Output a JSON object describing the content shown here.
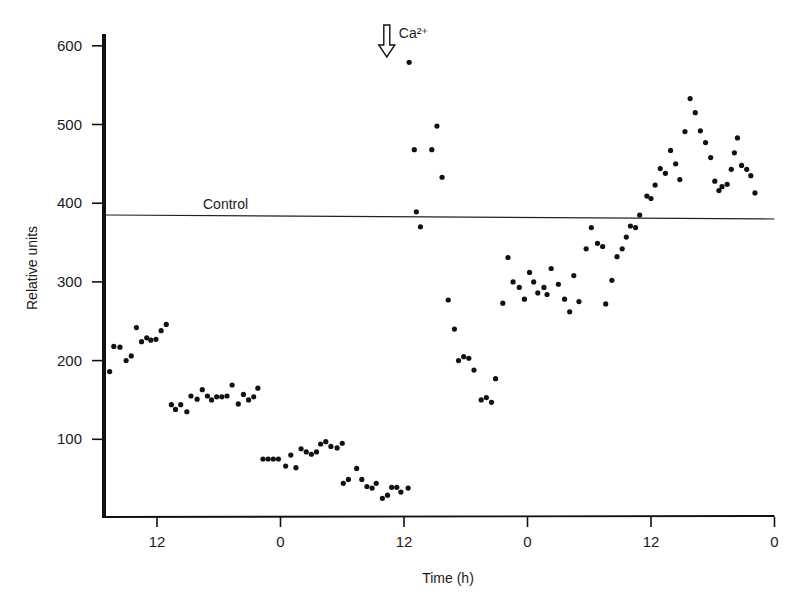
{
  "chart_data": {
    "type": "scatter",
    "title": "",
    "xlabel": "Time (h)",
    "ylabel": "Relative units",
    "x_axis": {
      "comment_units": "continuous hours; tick labels are clock hours",
      "range": [
        -5.2,
        60
      ],
      "ticks": [
        0,
        12,
        24,
        36,
        48,
        60
      ],
      "tick_labels": [
        "12",
        "0",
        "12",
        "0",
        "12",
        "0"
      ]
    },
    "y_axis": {
      "range": [
        0,
        615
      ],
      "ticks": [
        100,
        200,
        300,
        400,
        500,
        600
      ],
      "tick_labels": [
        "100",
        "200",
        "300",
        "400",
        "500",
        "600"
      ]
    },
    "grid": false,
    "legend": null,
    "reference_lines": [
      {
        "name": "Control",
        "label": "Control",
        "y": 385
      }
    ],
    "annotations": [
      {
        "label": "Ca²⁺",
        "type": "down-arrow",
        "x": 23.3,
        "y_top": 620
      }
    ],
    "series": [
      {
        "name": "Measurements",
        "points": [
          [
            -4.6,
            186
          ],
          [
            -4.2,
            218
          ],
          [
            -3.6,
            217
          ],
          [
            -3.0,
            200
          ],
          [
            -2.5,
            206
          ],
          [
            -2.0,
            242
          ],
          [
            -1.5,
            224
          ],
          [
            -1.0,
            229
          ],
          [
            -0.6,
            226
          ],
          [
            -0.1,
            227
          ],
          [
            0.4,
            238
          ],
          [
            0.9,
            246
          ],
          [
            1.4,
            144
          ],
          [
            1.8,
            138
          ],
          [
            2.3,
            144
          ],
          [
            2.9,
            135
          ],
          [
            3.3,
            155
          ],
          [
            3.9,
            151
          ],
          [
            4.4,
            163
          ],
          [
            4.9,
            155
          ],
          [
            5.3,
            150
          ],
          [
            5.8,
            154
          ],
          [
            6.3,
            154
          ],
          [
            6.8,
            155
          ],
          [
            7.3,
            169
          ],
          [
            7.9,
            145
          ],
          [
            8.4,
            157
          ],
          [
            8.9,
            150
          ],
          [
            9.4,
            154
          ],
          [
            9.8,
            165
          ],
          [
            10.3,
            75
          ],
          [
            10.8,
            75
          ],
          [
            11.3,
            75
          ],
          [
            11.8,
            75
          ],
          [
            12.5,
            66
          ],
          [
            13.0,
            80
          ],
          [
            13.5,
            64
          ],
          [
            14.0,
            88
          ],
          [
            14.5,
            84
          ],
          [
            15.0,
            81
          ],
          [
            15.5,
            84
          ],
          [
            15.9,
            94
          ],
          [
            16.4,
            97
          ],
          [
            16.9,
            91
          ],
          [
            17.5,
            89
          ],
          [
            18.0,
            95
          ],
          [
            18.1,
            44
          ],
          [
            18.6,
            49
          ],
          [
            19.4,
            63
          ],
          [
            19.9,
            49
          ],
          [
            20.4,
            40
          ],
          [
            20.9,
            38
          ],
          [
            21.3,
            44
          ],
          [
            21.9,
            25
          ],
          [
            22.4,
            29
          ],
          [
            22.8,
            39
          ],
          [
            23.3,
            39
          ],
          [
            23.7,
            33
          ],
          [
            24.4,
            38
          ],
          [
            24.5,
            579
          ],
          [
            25.0,
            468
          ],
          [
            25.2,
            389
          ],
          [
            25.6,
            370
          ],
          [
            26.7,
            468
          ],
          [
            27.2,
            498
          ],
          [
            27.7,
            433
          ],
          [
            28.3,
            277
          ],
          [
            28.9,
            240
          ],
          [
            29.3,
            200
          ],
          [
            29.8,
            205
          ],
          [
            30.3,
            203
          ],
          [
            30.8,
            188
          ],
          [
            31.5,
            150
          ],
          [
            32.0,
            153
          ],
          [
            32.5,
            147
          ],
          [
            32.9,
            177
          ],
          [
            33.6,
            273
          ],
          [
            34.1,
            331
          ],
          [
            34.6,
            300
          ],
          [
            35.2,
            293
          ],
          [
            35.7,
            278
          ],
          [
            36.2,
            312
          ],
          [
            36.6,
            300
          ],
          [
            37.0,
            286
          ],
          [
            37.6,
            293
          ],
          [
            37.9,
            284
          ],
          [
            38.3,
            317
          ],
          [
            39.0,
            297
          ],
          [
            39.6,
            278
          ],
          [
            40.1,
            262
          ],
          [
            40.5,
            308
          ],
          [
            41.0,
            275
          ],
          [
            41.7,
            342
          ],
          [
            42.2,
            369
          ],
          [
            42.8,
            349
          ],
          [
            43.3,
            345
          ],
          [
            43.6,
            272
          ],
          [
            44.2,
            302
          ],
          [
            44.7,
            332
          ],
          [
            45.2,
            342
          ],
          [
            45.6,
            357
          ],
          [
            46.0,
            371
          ],
          [
            46.5,
            369
          ],
          [
            46.9,
            385
          ],
          [
            47.6,
            409
          ],
          [
            48.0,
            406
          ],
          [
            48.4,
            423
          ],
          [
            48.9,
            444
          ],
          [
            49.4,
            438
          ],
          [
            49.9,
            467
          ],
          [
            50.4,
            450
          ],
          [
            50.8,
            430
          ],
          [
            51.3,
            491
          ],
          [
            51.8,
            533
          ],
          [
            52.3,
            515
          ],
          [
            52.8,
            492
          ],
          [
            53.3,
            477
          ],
          [
            53.8,
            458
          ],
          [
            54.2,
            428
          ],
          [
            54.6,
            416
          ],
          [
            54.9,
            421
          ],
          [
            55.4,
            424
          ],
          [
            55.8,
            443
          ],
          [
            56.1,
            464
          ],
          [
            56.4,
            483
          ],
          [
            56.8,
            448
          ],
          [
            57.3,
            443
          ],
          [
            57.7,
            435
          ],
          [
            58.1,
            413
          ]
        ]
      }
    ]
  }
}
